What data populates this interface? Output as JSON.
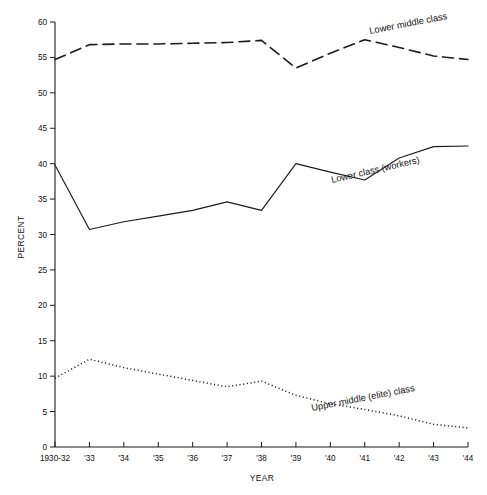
{
  "chart_data": {
    "type": "line",
    "title": "",
    "xlabel": "YEAR",
    "ylabel": "PERCENT",
    "ylim": [
      0,
      60
    ],
    "yticks": [
      0,
      5,
      10,
      15,
      20,
      25,
      30,
      35,
      40,
      45,
      50,
      55,
      60
    ],
    "ytick_labels": [
      "0",
      "5",
      "10",
      "15",
      "20",
      "25",
      "30",
      "35",
      "40",
      "45",
      "50",
      "55",
      "60"
    ],
    "categories": [
      "1930-32",
      "'33",
      "'34",
      "'35",
      "'36",
      "'37",
      "'38",
      "'39",
      "'40",
      "'41",
      "'42",
      "'43",
      "'44"
    ],
    "grid": false,
    "legend_position": "inline-annotations",
    "series": [
      {
        "name": "Lower middle class",
        "style": "dashed",
        "color": "#1c1c1c",
        "values": [
          54.7,
          56.8,
          56.9,
          56.9,
          57.0,
          57.1,
          57.4,
          53.5,
          55.6,
          57.5,
          56.4,
          55.2,
          54.7
        ]
      },
      {
        "name": "Lower class (workers)",
        "style": "solid",
        "color": "#1c1c1c",
        "values": [
          39.8,
          30.7,
          31.8,
          32.6,
          33.4,
          34.6,
          33.4,
          40.0,
          38.8,
          37.7,
          40.8,
          42.4,
          42.5
        ]
      },
      {
        "name": "Upper middle (elite) class",
        "style": "dotted",
        "color": "#1c1c1c",
        "values": [
          9.7,
          12.4,
          11.2,
          10.3,
          9.4,
          8.5,
          9.3,
          7.3,
          6.1,
          5.3,
          4.4,
          3.2,
          2.7
        ]
      }
    ],
    "annotations": [
      {
        "text": "Lower middle class",
        "series": "Lower middle class",
        "x": 370,
        "y": 34,
        "rotate": -11
      },
      {
        "text": "Lower class (workers)",
        "series": "Lower class (workers)",
        "x": 332,
        "y": 183,
        "rotate": -13
      },
      {
        "text": "Upper middle (elite) class",
        "series": "Upper middle (elite) class",
        "x": 312,
        "y": 411,
        "rotate": -11
      }
    ]
  }
}
